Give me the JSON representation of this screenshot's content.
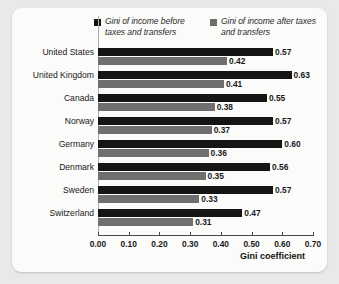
{
  "chart_data": {
    "type": "bar",
    "orientation": "horizontal",
    "title": "",
    "xlabel": "Gini coefficient",
    "ylabel": "",
    "xlim": [
      0.0,
      0.7
    ],
    "xticks": [
      "0.00",
      "0.10",
      "0.20",
      "0.30",
      "0.40",
      "0.50",
      "0.60",
      "0.70"
    ],
    "xtick_values": [
      0.0,
      0.1,
      0.2,
      0.3,
      0.4,
      0.5,
      0.6,
      0.7
    ],
    "grid": false,
    "legend_position": "top",
    "categories": [
      "United States",
      "United Kingdom",
      "Canada",
      "Norway",
      "Germany",
      "Denmark",
      "Sweden",
      "Switzerland"
    ],
    "series": [
      {
        "name": "Gini of income before taxes and transfers",
        "color": "#151515",
        "values": [
          0.57,
          0.63,
          0.55,
          0.57,
          0.6,
          0.56,
          0.57,
          0.47
        ],
        "labels": [
          "0.57",
          "0.63",
          "0.55",
          "0.57",
          "0.60",
          "0.56",
          "0.57",
          "0.47"
        ]
      },
      {
        "name": "Gini of income after taxes and transfers",
        "color": "#6f6f6f",
        "values": [
          0.42,
          0.41,
          0.38,
          0.37,
          0.36,
          0.35,
          0.33,
          0.31
        ],
        "labels": [
          "0.42",
          "0.41",
          "0.38",
          "0.37",
          "0.36",
          "0.35",
          "0.33",
          "0.31"
        ]
      }
    ]
  },
  "legend": {
    "entries": [
      {
        "label": "Gini of income before taxes and transfers",
        "swatch": "dark"
      },
      {
        "label": "Gini of income after taxes and transfers",
        "swatch": "light"
      }
    ]
  }
}
